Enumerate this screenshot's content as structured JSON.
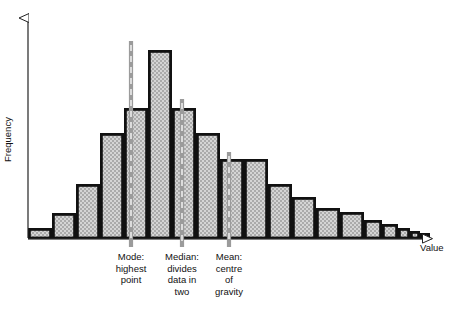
{
  "figure": {
    "title": "",
    "background": "#ffffff",
    "ink": "#111111",
    "bar_fill": "#c9c9c9",
    "bar_edge": "#111111",
    "marker_color": "#8a8a8a"
  },
  "axes": {
    "y_label": "Frequency",
    "x_label": "Value",
    "y_arrow": "up-arrow",
    "x_arrow": "right-arrow",
    "baseline_y": 238,
    "origin_x": 28
  },
  "markers": [
    {
      "id": "mode",
      "label": "Mode:\nhighest\npoint",
      "x": 131,
      "top_y": 41,
      "bottom_y": 247
    },
    {
      "id": "median",
      "label": "Median:\ndivides\ndata in\ntwo",
      "x": 182,
      "top_y": 99,
      "bottom_y": 247
    },
    {
      "id": "mean",
      "label": "Mean:\ncentre\nof\ngravity",
      "x": 229,
      "top_y": 152,
      "bottom_y": 247
    }
  ],
  "chart_data": {
    "type": "bar",
    "title": "",
    "xlabel": "Value",
    "ylabel": "Frequency",
    "grid": false,
    "legend": null,
    "axis_ticks": {
      "x": [],
      "y": []
    },
    "bar_count": 19,
    "bar_width_px": 24,
    "categories": [
      "b1",
      "b2",
      "b3",
      "b4",
      "b5",
      "b6",
      "b7",
      "b8",
      "b9",
      "b10",
      "b11",
      "b12",
      "b13",
      "b14",
      "b15",
      "b16",
      "b17",
      "b18",
      "b19"
    ],
    "values": [
      10,
      25,
      54,
      105,
      130,
      188,
      130,
      105,
      79,
      79,
      54,
      41,
      30,
      26,
      18,
      14,
      10,
      7,
      5
    ],
    "bar_tops_px": [
      228,
      213,
      184,
      133,
      108,
      50,
      108,
      133,
      159,
      159,
      184,
      197,
      208,
      212,
      220,
      224,
      228,
      231,
      233
    ],
    "bar_left_px": [
      28,
      52,
      76,
      100,
      124,
      148,
      172,
      196,
      220,
      244,
      268,
      292,
      316,
      340,
      364,
      382,
      398,
      410,
      420
    ],
    "bar_widths_px": [
      24,
      24,
      24,
      24,
      24,
      24,
      24,
      24,
      24,
      24,
      24,
      24,
      24,
      24,
      18,
      16,
      12,
      10,
      10
    ],
    "ylim": [
      0,
      200
    ],
    "annotations": [
      {
        "text": "Mode: highest point",
        "at_bar": 6
      },
      {
        "text": "Median: divides data in two",
        "at_bar": 7
      },
      {
        "text": "Mean: centre of gravity",
        "at_bar": 9
      }
    ]
  },
  "captions": {
    "mode": "Mode:\nhighest\npoint",
    "median": "Median:\ndivides\ndata in\ntwo",
    "mean": "Mean:\ncentre\nof\ngravity"
  }
}
